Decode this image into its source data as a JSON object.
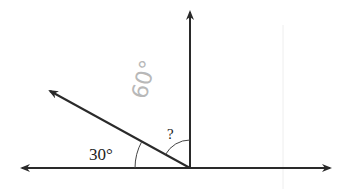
{
  "diagram": {
    "type": "angle-diagram",
    "labels": {
      "given_angle": "30°",
      "unknown_angle": "?",
      "handwritten_annotation": "60°"
    },
    "geometry": {
      "vertex": [
        190,
        168
      ],
      "horizontal_line": {
        "from": [
          22,
          168
        ],
        "to": [
          330,
          168
        ],
        "arrows": "both"
      },
      "vertical_ray": {
        "from": [
          190,
          168
        ],
        "to": [
          190,
          10
        ],
        "arrow": "end"
      },
      "diagonal_ray": {
        "from": [
          190,
          168
        ],
        "to": [
          48,
          90
        ],
        "arrow": "end"
      }
    },
    "angles": [
      {
        "name": "given",
        "between": [
          "horizontal-left",
          "diagonal"
        ],
        "value_label": "30°"
      },
      {
        "name": "unknown",
        "between": [
          "diagonal",
          "vertical"
        ],
        "value_label": "?"
      }
    ],
    "colors": {
      "line": "#2a2a2a",
      "arc": "#444444",
      "handwriting": "#b8b8b8",
      "faint_guide": "#eeeeee"
    }
  }
}
